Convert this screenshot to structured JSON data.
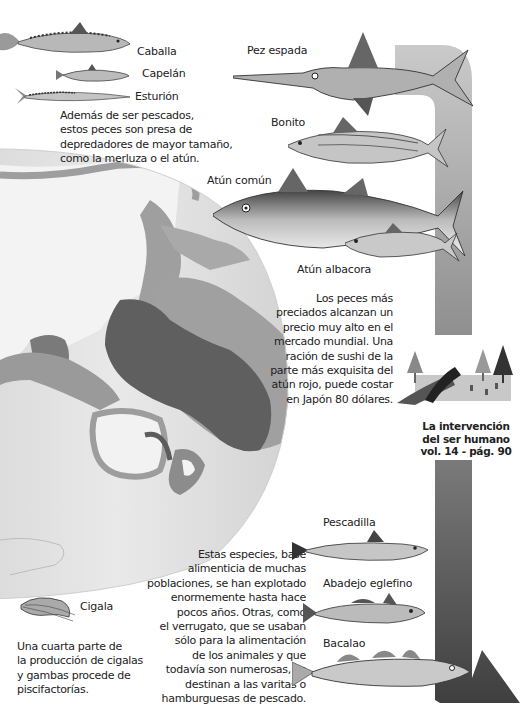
{
  "top_left": {
    "fish": [
      {
        "name": "Caballa"
      },
      {
        "name": "Capelán"
      },
      {
        "name": "Esturión"
      }
    ],
    "caption": [
      "Además de ser pescados,",
      "estos peces son presa de",
      "depredadores de mayor tamaño,",
      "como la merluza o el atún."
    ]
  },
  "top_right": {
    "fish": [
      {
        "name": "Pez espada"
      },
      {
        "name": "Bonito"
      },
      {
        "name": "Atún común"
      },
      {
        "name": "Atún albacora"
      }
    ],
    "caption": [
      "Los peces más",
      "preciados alcanzan un",
      "precio muy alto en el",
      "mercado mundial. Una",
      "ración de sushi de la",
      "parte más exquisita del",
      "atún rojo, puede costar",
      "en Japón 80 dólares."
    ]
  },
  "cross_reference": {
    "lines": [
      "La intervención",
      "del ser humano",
      "vol. 14 - pág. 90"
    ]
  },
  "bottom_middle": {
    "caption": [
      "Estas especies, base",
      "alimenticia de muchas",
      "poblaciones, se han explotado",
      "enormemente hasta hace",
      "pocos años. Otras, como",
      "el verrugato, que se usaban",
      "sólo para la alimentación",
      "de los animales y que",
      "todavía son numerosas, se",
      "destinan a las varitas o",
      "hamburguesas de pescado."
    ]
  },
  "bottom_right": {
    "fish": [
      {
        "name": "Pescadilla"
      },
      {
        "name": "Abadejo eglefino"
      },
      {
        "name": "Bacalao"
      }
    ]
  },
  "bottom_left": {
    "shellfish": {
      "name": "Cigala"
    },
    "caption": [
      "Una cuarta parte de",
      "la producción de cigalas",
      "y gambas procede de",
      "piscifactorías."
    ]
  },
  "colors": {
    "arrow_light": "#c4c4c4",
    "arrow_mid": "#9a9a9a",
    "arrow_dark": "#555555",
    "globe_ocean": "#e6e6e6",
    "globe_land": "#f3f3f3",
    "fishing_light": "#a9a9a9",
    "fishing_dark": "#5a5a5a"
  }
}
